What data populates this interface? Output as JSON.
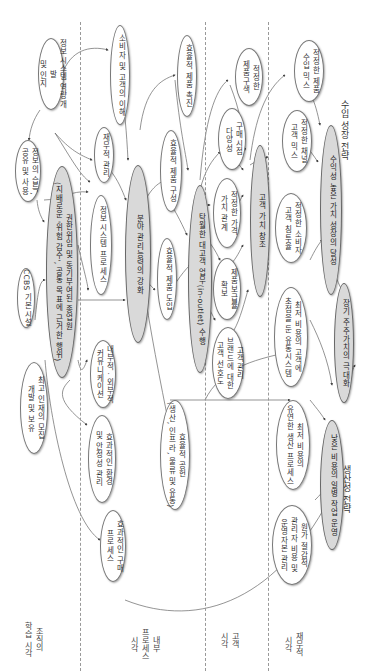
{
  "strategies": {
    "revenue_growth": "수입 성장 전략",
    "productivity": "생산성 전략"
  },
  "perspectives": [
    {
      "id": "financial",
      "label": "재무적\n시각"
    },
    {
      "id": "customer",
      "label": "고객\n시각"
    },
    {
      "id": "internal",
      "label": "내부\n프로세스\n시각"
    },
    {
      "id": "learning",
      "label": "조직의\n학습 시각"
    }
  ],
  "nodes": {
    "n_is_dev": "정보시스템 역량개발\n및 인지",
    "n_info_share": "정보의 습득,\n공유 및 사용",
    "n_ccbs": "CCBS 기본시설",
    "n_core_learning": "권한위임 및 동기부여된 종업원\n(지배로운 '위험 감수', 공통 목표에 근거한 행위)",
    "n_talent": "최고 인재의 모집\n개발 및 보유",
    "n_consumer_understand": "소비자 및 고객의 이해",
    "n_finance_mgmt": "재무적 관리",
    "n_is_process": "정보시스템 프로세스",
    "n_comm": "내부적 · 외부적\n커뮤니케이션",
    "n_env": "효과적인 환경\n및 안정성 관리",
    "n_purchase": "효과적인 구매\n프로세스",
    "n_promo": "효율적 제품 촉진",
    "n_composition": "효율적 제품 구성",
    "n_field_core": "분야 관리능력의 강화",
    "n_introduce": "효율적 제품 도입",
    "n_supply": "효율적 공헌\n(생산, 인프라, 물류 및 유통)",
    "n_key_account": "탁월한 대고객 업무(in-outlet) 수행",
    "n_optimal_mix": "적정한\n제품구색",
    "n_diversity": "구매시점\n다양성",
    "n_price": "적정한 가격\n가치 관계",
    "n_coverage": "제품보급률\n확보",
    "n_brand_pref": "고객관리\n브랜드에 대한\n고객 선호도",
    "n_cust_value": "고객 가치 창조",
    "n_rev_mix": "적정한 제품\n수입 믹스",
    "n_channel_mix": "적정한 채널\n고객 믹스",
    "n_consumer_pen": "적정한 소비자\n고객 침투율",
    "n_low_cost_sys": "최저 비용의 고객에\n초점을 둔 유통시스템",
    "n_low_cost_prod": "최저 비용의\n유연한 생산 프로세스",
    "n_overhead": "원가 절감적\n관리자 비용 및\n운영자본 관리",
    "n_high_profit": "수익성 높은 가치 성장의 달성",
    "n_shareholder": "장기 주주가치의 극대화",
    "n_low_cost_ops": "낮은 비용의 일병 작업 운영"
  },
  "colors": {
    "core_fill": "#d9d9d9",
    "node_fill": "#ffffff",
    "border": "#777777",
    "divider": "#999999"
  }
}
